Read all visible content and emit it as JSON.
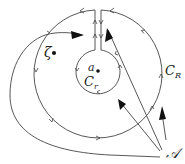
{
  "diagram": {
    "type": "contour-integration-diagram",
    "labels": {
      "zeta": "ζ",
      "a": "a",
      "C_r_main": "C",
      "C_r_sub": "r",
      "C_R_main": "C",
      "C_R_sub": "R",
      "A": "𝒜"
    },
    "colors": {
      "stroke": "#444444",
      "arrow": "#111111",
      "text": "#222222"
    }
  }
}
